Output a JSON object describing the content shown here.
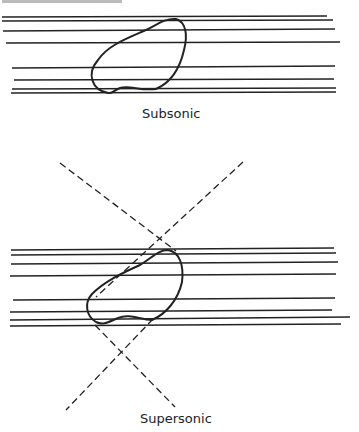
{
  "diagram": {
    "panels": [
      {
        "label": "Subsonic"
      },
      {
        "label": "Supersonic"
      }
    ]
  }
}
